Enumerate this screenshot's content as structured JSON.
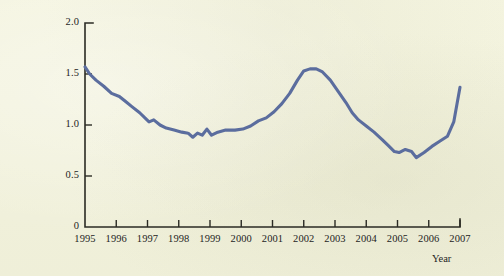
{
  "figure": {
    "background_color": "#f0f0da",
    "line_color": "#5b6d9e",
    "axis_color": "#2b2b24"
  },
  "axis_title_year": "Year",
  "chart_data": {
    "type": "line",
    "title": "",
    "subtitle": "",
    "xlabel": "Year",
    "ylabel": "",
    "xlim": [
      1995,
      2007
    ],
    "ylim": [
      0,
      2.0
    ],
    "grid": false,
    "legend": "none",
    "y_ticks": [
      0,
      0.5,
      1.0,
      1.5,
      2.0
    ],
    "y_tick_labels": [
      "0",
      "0.5",
      "1.0",
      "1.5",
      "2.0"
    ],
    "x_ticks": [
      1995,
      1996,
      1997,
      1998,
      1999,
      2000,
      2001,
      2002,
      2003,
      2004,
      2005,
      2006,
      2007
    ],
    "x_tick_labels": [
      "1995",
      "1996",
      "1997",
      "1998",
      "1999",
      "2000",
      "2001",
      "2002",
      "2003",
      "2004",
      "2005",
      "2006",
      "2007"
    ],
    "series": [
      {
        "name": "series-1",
        "color": "#5b6d9e",
        "x": [
          1995.0,
          1995.15,
          1995.35,
          1995.6,
          1995.85,
          1996.1,
          1996.3,
          1996.5,
          1996.75,
          1996.95,
          1997.05,
          1997.2,
          1997.4,
          1997.6,
          1997.85,
          1998.1,
          1998.3,
          1998.45,
          1998.6,
          1998.75,
          1998.9,
          1999.05,
          1999.25,
          1999.5,
          1999.8,
          2000.05,
          2000.3,
          2000.55,
          2000.8,
          2001.05,
          2001.3,
          2001.55,
          2001.8,
          2002.0,
          2002.2,
          2002.4,
          2002.6,
          2002.85,
          2003.1,
          2003.35,
          2003.55,
          2003.75,
          2004.0,
          2004.25,
          2004.5,
          2004.7,
          2004.9,
          2005.05,
          2005.25,
          2005.45,
          2005.6,
          2005.85,
          2006.1,
          2006.35,
          2006.6,
          2006.8,
          2007.0
        ],
        "y": [
          1.57,
          1.5,
          1.44,
          1.38,
          1.31,
          1.28,
          1.23,
          1.18,
          1.12,
          1.06,
          1.03,
          1.05,
          1.0,
          0.97,
          0.95,
          0.93,
          0.92,
          0.88,
          0.92,
          0.9,
          0.96,
          0.9,
          0.93,
          0.95,
          0.95,
          0.96,
          0.99,
          1.04,
          1.07,
          1.13,
          1.21,
          1.31,
          1.44,
          1.53,
          1.55,
          1.55,
          1.52,
          1.44,
          1.33,
          1.22,
          1.12,
          1.05,
          0.99,
          0.93,
          0.86,
          0.8,
          0.74,
          0.73,
          0.76,
          0.74,
          0.68,
          0.73,
          0.79,
          0.84,
          0.89,
          1.03,
          1.37
        ]
      }
    ]
  }
}
